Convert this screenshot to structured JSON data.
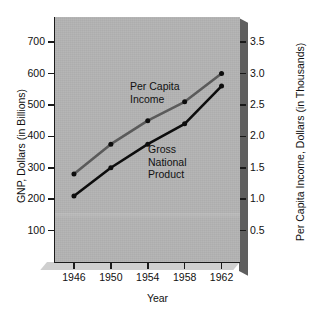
{
  "chart_data": {
    "type": "line",
    "title": "",
    "xlabel": "Year",
    "ylabel": "GNP, Dollars (in Billions)",
    "ylabel_secondary": "Per Capita Income, Dollars (in Thousands)",
    "x": [
      1946,
      1950,
      1954,
      1958,
      1962
    ],
    "xticklabels": [
      "1946",
      "1950",
      "1954",
      "1958",
      "1962"
    ],
    "xlim": [
      1944,
      1964
    ],
    "ylim": [
      0,
      780
    ],
    "yticks": [
      100,
      200,
      300,
      400,
      500,
      600,
      700
    ],
    "yticklabels": [
      "100",
      "200",
      "300",
      "400",
      "500",
      "600",
      "700"
    ],
    "ylim_secondary": [
      0,
      3.9
    ],
    "yticks_secondary": [
      0.5,
      1.0,
      1.5,
      2.0,
      2.5,
      3.0,
      3.5
    ],
    "yticklabels_secondary": [
      "0.5",
      "1.0",
      "1.5",
      "2.0",
      "2.5",
      "3.0",
      "3.5"
    ],
    "grid": false,
    "legend": "inline-annotations",
    "series": [
      {
        "name": "Per Capita Income",
        "axis": "right",
        "color": "#5a5a5a",
        "marker_color": "#0d0d0d",
        "values_left_scale": [
          280,
          375,
          450,
          510,
          600
        ],
        "values": [
          1.4,
          1.88,
          2.25,
          2.55,
          3.0
        ]
      },
      {
        "name": "Gross National Product",
        "axis": "left",
        "color": "#0d0d0d",
        "marker_color": "#0d0d0d",
        "values": [
          210,
          300,
          375,
          440,
          560
        ]
      }
    ],
    "annotations": [
      {
        "text": "Per Capita\nIncome",
        "series": "Per Capita Income"
      },
      {
        "text": "Gross\nNational\nProduct",
        "series": "Gross National Product"
      }
    ]
  },
  "panel": {
    "background_color": "#b3b3b3",
    "axis_color": "#1a1a1a",
    "shadow_color": "#5f5f5f"
  },
  "axes": {
    "left": {
      "title": "GNP, Dollars (in Billions)",
      "ticklabels": [
        "700",
        "600",
        "500",
        "400",
        "300",
        "200",
        "100"
      ]
    },
    "right": {
      "title": "Per Capita Income, Dollars (in Thousands)",
      "ticklabels": [
        "3.5",
        "3.0",
        "2.5",
        "2.0",
        "1.5",
        "1.0",
        "0.5"
      ]
    },
    "bottom": {
      "title": "Year",
      "ticklabels": [
        "1946",
        "1950",
        "1954",
        "1958",
        "1962"
      ]
    }
  },
  "labels": {
    "per_capita": "Per Capita\nIncome",
    "gross_national_product": "Gross\nNational\nProduct"
  }
}
